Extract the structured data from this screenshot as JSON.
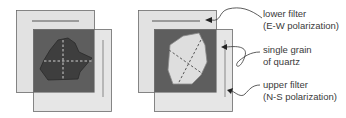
{
  "colors": {
    "filter": "#e2e2e2",
    "filter_border": "#6a6a6a",
    "overlap": "#5e5e5e",
    "grain_dark": "#3e3e3e",
    "grain_light": "#dedede",
    "dash_light": "#cfcfcf",
    "dash_dark": "#5a5a5a",
    "text": "#3a3a3a"
  },
  "labels": {
    "lower_filter": {
      "line1": "lower filter",
      "line2": "(E-W polarization)"
    },
    "grain": {
      "line1": "single grain",
      "line2": "of quartz"
    },
    "upper_filter": {
      "line1": "upper filter",
      "line2": "(N-S polarization)"
    }
  },
  "panels": [
    {
      "name": "crossed-polars-extinction",
      "grain_state": "dark"
    },
    {
      "name": "crossed-polars-bright",
      "grain_state": "light"
    }
  ]
}
